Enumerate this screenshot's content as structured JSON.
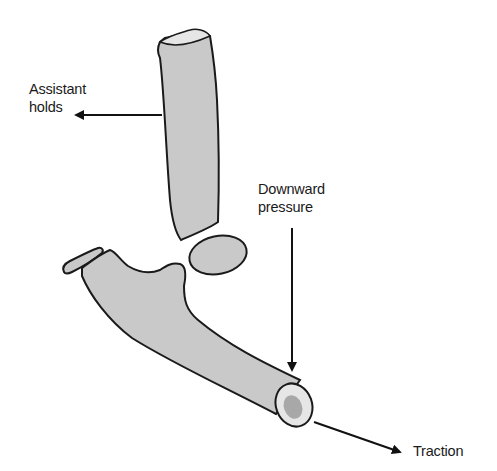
{
  "diagram": {
    "colors": {
      "bone_fill": "#c9c9c9",
      "bone_end_fill": "#e6e6e6",
      "marrow_fill": "#a8a8a8",
      "outline": "#1a1a1a",
      "arrow": "#111111",
      "text": "#1a1a1a"
    },
    "labels": {
      "assistant_line1": "Assistant",
      "assistant_line2": "holds",
      "downward_line1": "Downward",
      "downward_line2": "pressure",
      "traction": "Traction"
    },
    "elements": [
      {
        "name": "upper-bone-shaft",
        "label": "Proximal bone segment"
      },
      {
        "name": "small-fragment-oval",
        "label": "Round bone fragment"
      },
      {
        "name": "thin-fragment",
        "label": "Thin bone fragment"
      },
      {
        "name": "lower-bone",
        "label": "Distal bone with articular end"
      }
    ],
    "arrows": [
      {
        "name": "assistant-holds-arrow",
        "direction": "left"
      },
      {
        "name": "downward-pressure-arrow",
        "direction": "down"
      },
      {
        "name": "traction-arrow",
        "direction": "down-right"
      }
    ]
  }
}
